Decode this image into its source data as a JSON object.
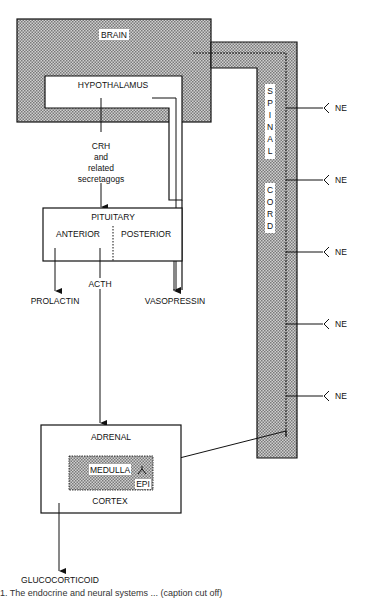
{
  "diagram": {
    "nodes": {
      "brain": "BRAIN",
      "hypothalamus": "HYPOTHALAMUS",
      "crh_line1": "CRH",
      "crh_line2": "and",
      "crh_line3": "related",
      "crh_line4": "secretagogs",
      "pituitary": "PITUITARY",
      "anterior": "ANTERIOR",
      "posterior": "POSTERIOR",
      "prolactin": "PROLACTIN",
      "acth": "ACTH",
      "vasopressin": "VASOPRESSIN",
      "adrenal": "ADRENAL",
      "medulla": "MEDULLA",
      "epi": "EPI",
      "cortex": "CORTEX",
      "glucocorticoid": "GLUCOCORTICOID",
      "spinal_letters": [
        "S",
        "P",
        "I",
        "N",
        "A",
        "L"
      ],
      "cord_letters": [
        "C",
        "O",
        "R",
        "D"
      ],
      "ne_labels": [
        "NE",
        "NE",
        "NE",
        "NE",
        "NE"
      ]
    },
    "colors": {
      "stroke": "#111111",
      "shade": "#b8b8b8",
      "background": "#ffffff"
    }
  },
  "caption": {
    "text": "1.  The endocrine and neural systems ... (caption cut off)"
  }
}
